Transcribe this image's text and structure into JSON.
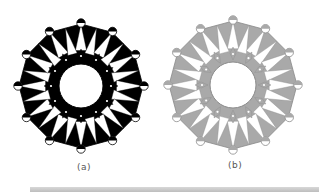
{
  "figure": {
    "panels": [
      {
        "id": "a",
        "caption": "(a)",
        "center": [
          81,
          86
        ],
        "outer_radius": 62,
        "star_radius": 46,
        "inner_radius": 22,
        "points": 12,
        "fill_color": "#000000",
        "background_color": "#ffffff",
        "stroke_color": "#000000"
      },
      {
        "id": "b",
        "caption": "(b)",
        "center": [
          233,
          85
        ],
        "outer_radius": 64,
        "star_radius": 47,
        "inner_radius": 23,
        "points": 12,
        "fill_color": "#a9a9a9",
        "background_color": "#ffffff",
        "stroke_color": "#8a8a8a"
      }
    ]
  },
  "captions": {
    "a": "(a)",
    "b": "(b)"
  },
  "colors": {
    "bottom_band": "#c4c4c4"
  }
}
